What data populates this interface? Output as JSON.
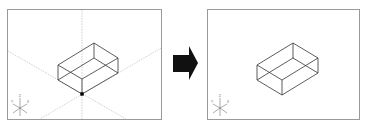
{
  "caption": {
    "text": ""
  },
  "panels": [
    {
      "name": "before",
      "frame": {
        "x": 7,
        "y": 9,
        "w": 154,
        "h": 110
      },
      "box": {
        "back_top": [
          94,
          43
        ],
        "right_top": [
          118,
          58
        ],
        "left_top": [
          58,
          65
        ],
        "front_top": [
          82,
          79
        ],
        "height": 15
      },
      "base_point": [
        82,
        94
      ],
      "guide_lines": true,
      "axis_triad": {
        "x": 20,
        "y": 108,
        "labels": [
          "Z",
          "Y",
          "X"
        ]
      }
    },
    {
      "name": "after",
      "frame": {
        "x": 207,
        "y": 9,
        "w": 152,
        "h": 110
      },
      "box": {
        "back_top": [
          293,
          43
        ],
        "right_top": [
          318,
          58
        ],
        "left_top": [
          257,
          65
        ],
        "front_top": [
          282,
          80
        ],
        "height": 15
      },
      "guide_lines": false,
      "axis_triad": {
        "x": 220,
        "y": 108,
        "labels": [
          "Z",
          "Y",
          "X"
        ]
      }
    }
  ],
  "arrow": {
    "direction": "right",
    "color": "#111111"
  },
  "colors": {
    "frame": "#9a9a9a",
    "box_edge": "#333333",
    "guide": "#b0b0b0",
    "point": "#000000"
  }
}
